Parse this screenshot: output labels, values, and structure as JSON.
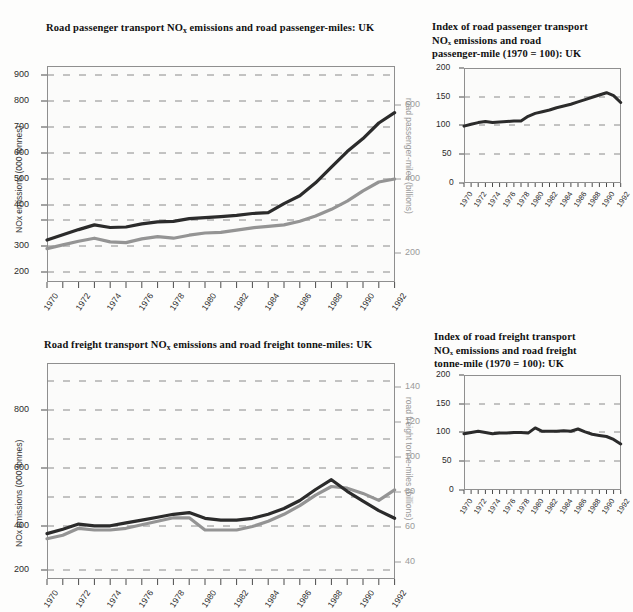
{
  "page": {
    "background": "#fdfdfc",
    "series_colors": {
      "emissions": "#2b2b2b",
      "activity": "#949494"
    },
    "grid_color": "#8a8a8a",
    "axis_color": "#8f8f8f"
  },
  "charts": [
    {
      "id": "road-passenger-emissions-and-passenger-miles",
      "title_parts": {
        "a": "Road passenger transport NO",
        "sub": "x",
        "b": " emissions and road passenger-miles: UK"
      },
      "ylabel_left": "NOx emissions (000 tonnes)",
      "ylabel_right": "road passenger-miles (billions)",
      "chart_data": {
        "type": "line",
        "title": "Road passenger transport NOx emissions and road passenger-miles: UK",
        "xlabel": "",
        "ylabel": "NOx emissions (000 tonnes)",
        "ylabel2": "road passenger-miles (billions)",
        "grid": true,
        "legend": "none",
        "xlim": [
          1970,
          1992
        ],
        "ylim": [
          150,
          950
        ],
        "ylim2": [
          100,
          700
        ],
        "yticks": [
          200,
          300,
          400,
          500,
          600,
          700,
          800,
          900
        ],
        "yticks2": [
          200,
          400,
          600
        ],
        "x": [
          1970,
          1971,
          1972,
          1973,
          1974,
          1975,
          1976,
          1977,
          1978,
          1979,
          1980,
          1981,
          1982,
          1983,
          1984,
          1985,
          1986,
          1987,
          1988,
          1989,
          1990,
          1991,
          1992
        ],
        "xticklabels": [
          "1970",
          "",
          "1972",
          "",
          "1974",
          "",
          "1976",
          "",
          "1978",
          "",
          "1980",
          "",
          "1982",
          "",
          "1984",
          "",
          "1986",
          "",
          "1988",
          "",
          "1990",
          "",
          "1992"
        ],
        "series": [
          {
            "name": "NOx emissions (000 tonnes)",
            "axis": "left",
            "color": "#2b2b2b",
            "values": [
              310,
              330,
              350,
              368,
              358,
              360,
              372,
              380,
              382,
              392,
              396,
              400,
              405,
              412,
              415,
              450,
              480,
              530,
              590,
              650,
              700,
              760,
              800
            ]
          },
          {
            "name": "road passenger-miles (billions)",
            "axis": "right",
            "color": "#949494",
            "values": [
              212,
              222,
              232,
              240,
              230,
              228,
              238,
              244,
              240,
              248,
              254,
              256,
              262,
              268,
              272,
              276,
              286,
              300,
              318,
              340,
              368,
              392,
              400
            ]
          }
        ],
        "series_left_display": [
          310,
          330,
          350,
          368,
          358,
          360,
          372,
          380,
          382,
          392,
          396,
          400,
          405,
          412,
          415,
          450,
          480,
          530,
          590,
          650,
          700,
          760,
          800
        ],
        "notes": "dark line peaks ~865 in 1990 then falls to ~770 by 1992; grey line plateaus ~405 from 1989"
      }
    },
    {
      "id": "index-road-passenger",
      "title_parts": {
        "a": "Index of road passenger transport\nNO",
        "sub": "x",
        "b": " emissions and road\npassenger-mile (1970 = 100): UK"
      },
      "title_lines": [
        "Index of road passenger transport",
        "NOₓ emissions and road",
        "passenger-mile (1970 = 100): UK"
      ],
      "chart_data": {
        "type": "line",
        "title": "Index of road passenger transport NOx emissions and road passenger-mile (1970 = 100): UK",
        "xlabel": "",
        "ylabel": "",
        "grid": true,
        "legend": "none",
        "xlim": [
          1970,
          1992
        ],
        "ylim": [
          0,
          200
        ],
        "yticks": [
          0,
          50,
          100,
          150,
          200
        ],
        "x": [
          1970,
          1971,
          1972,
          1973,
          1974,
          1975,
          1976,
          1977,
          1978,
          1979,
          1980,
          1981,
          1982,
          1983,
          1984,
          1985,
          1986,
          1987,
          1988,
          1989,
          1990,
          1991,
          1992
        ],
        "xticklabels": [
          "1970",
          "",
          "1972",
          "",
          "1974",
          "",
          "1976",
          "",
          "1978",
          "",
          "1980",
          "",
          "1982",
          "",
          "1984",
          "",
          "1986",
          "",
          "1988",
          "",
          "1990",
          "",
          "1992"
        ],
        "series": [
          {
            "name": "index",
            "color": "#2b2b2b",
            "values": [
              99,
              102,
              105,
              107,
              105,
              106,
              107,
              108,
              108,
              116,
              121,
              124,
              127,
              131,
              134,
              137,
              141,
              145,
              149,
              153,
              157,
              152,
              140
            ]
          }
        ]
      }
    },
    {
      "id": "road-freight-emissions-and-tonne-miles",
      "title_parts": {
        "a": "Road freight transport NO",
        "sub": "x",
        "b": " emissions and road freight tonne-miles: UK"
      },
      "ylabel_left": "NOx emissions (000 tonnes)",
      "ylabel_right": "road freight tonne-miles (billions)",
      "chart_data": {
        "type": "line",
        "title": "Road freight transport NOx emissions and road freight tonne-miles: UK",
        "xlabel": "",
        "ylabel": "NOx emissions (000 tonnes)",
        "ylabel2": "road freight tonne-miles (billions)",
        "grid": true,
        "legend": "none",
        "xlim": [
          1970,
          1992
        ],
        "ylim": [
          150,
          900
        ],
        "ylim2": [
          28,
          152
        ],
        "yticks": [
          200,
          400,
          600,
          800
        ],
        "yticks2": [
          40,
          60,
          80,
          100,
          120,
          140
        ],
        "x": [
          1970,
          1971,
          1972,
          1973,
          1974,
          1975,
          1976,
          1977,
          1978,
          1979,
          1980,
          1981,
          1982,
          1983,
          1984,
          1985,
          1986,
          1987,
          1988,
          1989,
          1990,
          1991,
          1992
        ],
        "xticklabels": [
          "1970",
          "",
          "1972",
          "",
          "1974",
          "",
          "1976",
          "",
          "1978",
          "",
          "1980",
          "",
          "1982",
          "",
          "1984",
          "",
          "1986",
          "",
          "1988",
          "",
          "1990",
          "",
          "1992"
        ],
        "series": [
          {
            "name": "NOx emissions (000 tonnes)",
            "axis": "left",
            "color": "#2b2b2b",
            "values": [
              325,
              340,
              358,
              352,
              352,
              362,
              372,
              382,
              392,
              398,
              378,
              372,
              372,
              378,
              392,
              412,
              440,
              478,
              512,
              472,
              438,
              405,
              378
            ]
          },
          {
            "name": "road freight tonne-miles (billions)",
            "axis": "right",
            "color": "#949494",
            "values": [
              54,
              56,
              60,
              59,
              59,
              60,
              62,
              64,
              66,
              66,
              59,
              59,
              59,
              61,
              64,
              68,
              73,
              79,
              84,
              83,
              80,
              76,
              82
            ]
          }
        ],
        "notes": "dark emissions line peaks ~512 in 1988 then falls to ~378 (~59 bn equiv on right) by 1992; grey tonne-miles dips 1980 and recovers to ~82 bn"
      }
    },
    {
      "id": "index-road-freight",
      "title_lines": [
        "Index of road freight transport",
        "NOₓ emissions and road freight",
        "tonne-mile (1970 = 100): UK"
      ],
      "chart_data": {
        "type": "line",
        "title": "Index of road freight transport NOx emissions and road freight tonne-mile (1970 = 100): UK",
        "xlabel": "",
        "ylabel": "",
        "grid": true,
        "legend": "none",
        "xlim": [
          1970,
          1992
        ],
        "ylim": [
          0,
          200
        ],
        "yticks": [
          0,
          50,
          100,
          150,
          200
        ],
        "x": [
          1970,
          1971,
          1972,
          1973,
          1974,
          1975,
          1976,
          1977,
          1978,
          1979,
          1980,
          1981,
          1982,
          1983,
          1984,
          1985,
          1986,
          1987,
          1988,
          1989,
          1990,
          1991,
          1992
        ],
        "xticklabels": [
          "1970",
          "",
          "1972",
          "",
          "1974",
          "",
          "1976",
          "",
          "1978",
          "",
          "1980",
          "",
          "1982",
          "",
          "1984",
          "",
          "1986",
          "",
          "1988",
          "",
          "1990",
          "",
          "1992"
        ],
        "series": [
          {
            "name": "index",
            "color": "#2b2b2b",
            "values": [
              98,
              100,
              102,
              100,
              98,
              99,
              99,
              100,
              100,
              99,
              108,
              102,
              102,
              102,
              103,
              102,
              106,
              101,
              97,
              95,
              93,
              88,
              80
            ]
          }
        ]
      }
    }
  ],
  "xaxis": {
    "labels": [
      "1970",
      "1972",
      "1974",
      "1976",
      "1978",
      "1980",
      "1982",
      "1984",
      "1986",
      "1988",
      "1990",
      "1992"
    ],
    "first_year": 1970,
    "last_year": 1992
  }
}
